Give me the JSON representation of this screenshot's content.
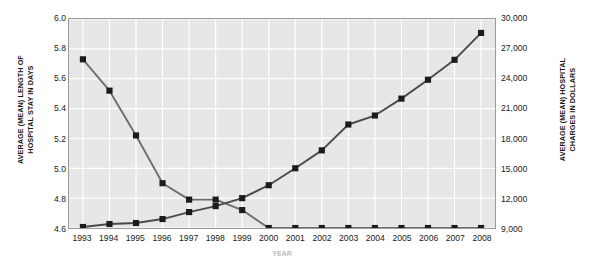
{
  "chart_data": {
    "type": "line",
    "title": "",
    "xlabel": "YEAR",
    "grid": true,
    "legend": "none",
    "categories": [
      "1993",
      "1994",
      "1995",
      "1996",
      "1997",
      "1998",
      "1999",
      "2000",
      "2001",
      "2002",
      "2003",
      "2004",
      "2005",
      "2006",
      "2007",
      "2008"
    ],
    "x": [
      1993,
      1994,
      1995,
      1996,
      1997,
      1998,
      1999,
      2000,
      2001,
      2002,
      2003,
      2004,
      2005,
      2006,
      2007,
      2008
    ],
    "axes": {
      "left": {
        "label": "AVERAGE (MEAN) LENGTH OF HOSPITAL STAY IN DAYS",
        "ticks": [
          "6.0",
          "5.8",
          "5.6",
          "5.4",
          "5.2",
          "5.0",
          "4.8",
          "4.6"
        ],
        "tick_values": [
          6.0,
          5.8,
          5.6,
          5.4,
          5.2,
          5.0,
          4.8,
          4.6
        ],
        "min": 4.6,
        "max": 6.0
      },
      "right": {
        "label": "AVERAGE (MEAN) HOSPITAL CHARGES IN DOLLARS",
        "ticks": [
          "30,000",
          "27,000",
          "24,000",
          "21,000",
          "18,000",
          "15,000",
          "12,000",
          "9,000"
        ],
        "tick_values": [
          30000,
          27000,
          24000,
          21000,
          18000,
          15000,
          12000,
          9000
        ],
        "min": 9000,
        "max": 30000
      }
    },
    "series": [
      {
        "name": "Average (mean) length of hospital stay in days",
        "axis": "left",
        "color": "#6e6e6e",
        "marker": "square",
        "values": [
          5.73,
          5.52,
          5.22,
          4.9,
          4.79,
          4.79,
          4.72,
          4.6,
          4.6,
          4.6,
          4.6,
          4.6,
          4.6,
          4.6,
          4.6,
          4.6
        ]
      },
      {
        "name": "Average (mean) hospital charges in dollars",
        "axis": "right",
        "color": "#4a4a4a",
        "marker": "square",
        "values": [
          9100,
          9400,
          9500,
          9900,
          10600,
          11200,
          12000,
          13300,
          15000,
          16800,
          19400,
          20300,
          22000,
          23900,
          25900,
          28600
        ]
      }
    ]
  },
  "colors": {
    "plot_background": "#e7e7e7",
    "gridline": "#ffffff",
    "plot_border": "#9a9a9a",
    "series_los": "#6e6e6e",
    "series_charges": "#4a4a4a",
    "text": "#1a1a1a"
  }
}
